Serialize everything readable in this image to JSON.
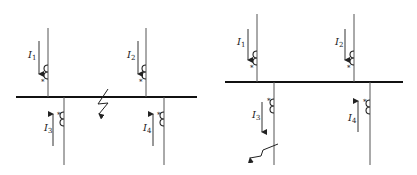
{
  "diagrams": [
    {
      "name": "left",
      "description": "Busbar with external/internal fault on the bus",
      "currents": [
        {
          "label": "I",
          "sub": "1",
          "direction": "down"
        },
        {
          "label": "I",
          "sub": "2",
          "direction": "down"
        },
        {
          "label": "I",
          "sub": "3",
          "direction": "up"
        },
        {
          "label": "I",
          "sub": "4",
          "direction": "up"
        }
      ],
      "polarity_mark": "*",
      "fault_location": "bus"
    },
    {
      "name": "right",
      "description": "Busbar with fault on outgoing feeder 3",
      "currents": [
        {
          "label": "I",
          "sub": "1",
          "direction": "down"
        },
        {
          "label": "I",
          "sub": "2",
          "direction": "down"
        },
        {
          "label": "I",
          "sub": "3",
          "direction": "down"
        },
        {
          "label": "I",
          "sub": "4",
          "direction": "up"
        }
      ],
      "polarity_mark": "*",
      "fault_location": "feeder-3"
    }
  ],
  "colors": {
    "line": "#555555",
    "bus": "#111111",
    "text": "#222222"
  }
}
